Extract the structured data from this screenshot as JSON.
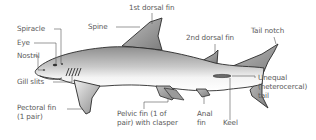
{
  "colors": {
    "label_text": "#5a5a5a",
    "leader_line": "#555555",
    "outline": "#2a2a2a",
    "body_dark": "#9a9a9a",
    "body_light": "#f2f2f2"
  },
  "labels": {
    "spiracle": "Spiracle",
    "eye": "Eye",
    "nostril": "Nostril",
    "gill_slits": "Gill slits",
    "pectoral_fin_1": "Pectoral fin",
    "pectoral_fin_2": "(1 pair)",
    "spine": "Spine",
    "first_dorsal_fin": "1st dorsal fin",
    "second_dorsal_fin": "2nd dorsal fin",
    "tail_notch": "Tail notch",
    "unequal_tail_1": "Unequal",
    "unequal_tail_2": "(heterocercal)",
    "unequal_tail_3": "tail",
    "pelvic_fin_1": "Pelvic fin (1 of",
    "pelvic_fin_2": "pair) with clasper",
    "anal_fin_1": "Anal",
    "anal_fin_2": "fin",
    "keel": "Keel"
  }
}
